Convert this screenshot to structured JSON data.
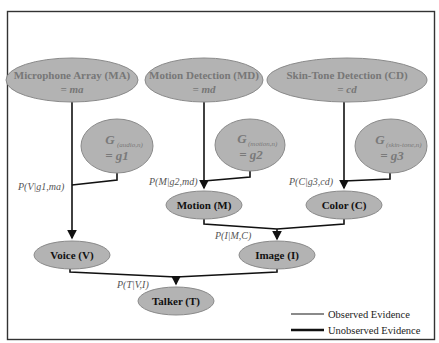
{
  "diagram": {
    "type": "bayesian-network",
    "nodes": {
      "mic_array": {
        "line1": "Microphone Array (MA)",
        "line2": "= ma",
        "observed": true
      },
      "motion_detection": {
        "line1": "Motion Detection (MD)",
        "line2": "= md",
        "observed": true
      },
      "skin_tone_detection": {
        "line1": "Skin-Tone Detection (CD)",
        "line2": "= cd",
        "observed": true
      },
      "gate_audio": {
        "symbol": "G",
        "subscript": "(audio,n)",
        "value": "= g1",
        "observed": true
      },
      "gate_motion": {
        "symbol": "G",
        "subscript": "(motion,n)",
        "value": "= g2",
        "observed": true
      },
      "gate_skin": {
        "symbol": "G",
        "subscript": "(skin-tone,n)",
        "value": "= g3",
        "observed": true
      },
      "motion": {
        "label": "Motion (M)",
        "observed": false
      },
      "color": {
        "label": "Color (C)",
        "observed": false
      },
      "voice": {
        "label": "Voice (V)",
        "observed": false
      },
      "image": {
        "label": "Image (I)",
        "observed": false
      },
      "talker": {
        "label": "Talker (T)",
        "observed": false
      }
    },
    "probabilities": {
      "voice": "P(V|g1,ma)",
      "motion": "P(M|g2,md)",
      "color": "P(C|g3,cd)",
      "image": "P(I|M,C)",
      "talker": "P(T|V,I)"
    },
    "edges": [
      {
        "from": "mic_array",
        "to": "voice"
      },
      {
        "from": "gate_audio",
        "to": "voice"
      },
      {
        "from": "motion_detection",
        "to": "motion"
      },
      {
        "from": "gate_motion",
        "to": "motion"
      },
      {
        "from": "skin_tone_detection",
        "to": "color"
      },
      {
        "from": "gate_skin",
        "to": "color"
      },
      {
        "from": "motion",
        "to": "image"
      },
      {
        "from": "color",
        "to": "image"
      },
      {
        "from": "voice",
        "to": "talker"
      },
      {
        "from": "image",
        "to": "talker"
      }
    ],
    "legend": {
      "observed": {
        "label": "Observed Evidence",
        "color": "#8a8a8a"
      },
      "unobserved": {
        "label": "Unobserved Evidence",
        "color": "#111111"
      }
    }
  }
}
